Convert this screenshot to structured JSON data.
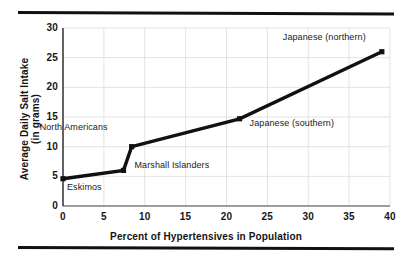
{
  "figure": {
    "top_rule": "horizontal-rule",
    "bottom_rule": "horizontal-rule"
  },
  "chart_data": {
    "type": "line",
    "title": "",
    "xlabel": "Percent of Hypertensives in Population",
    "ylabel": "Average Daily Salt Intake (in grams)",
    "ylabel_line1": "Average Daily Salt Intake",
    "ylabel_line2": "(in grams)",
    "xlim": [
      0,
      40
    ],
    "ylim": [
      0,
      30
    ],
    "xticks": [
      "0",
      "5",
      "10",
      "15",
      "20",
      "25",
      "30",
      "35",
      "40"
    ],
    "yticks": [
      "0",
      "5",
      "10",
      "15",
      "20",
      "25",
      "30"
    ],
    "grid": true,
    "legend": "none",
    "marker": "square",
    "line_color": "#111111",
    "grid_color": "#d8d8d8",
    "axis_color": "#4a4a4a",
    "x": [
      0,
      7.4,
      8.4,
      21.6,
      39.0
    ],
    "y": [
      4.6,
      6.0,
      10.0,
      14.7,
      26.0
    ],
    "point_labels": [
      "Eskimos",
      "Marshall Islanders",
      "North Americans",
      "Japanese (southern)",
      "Japanese (northern)"
    ],
    "annotations": [
      {
        "text": "Eskimos",
        "x": 0,
        "y": 4.6
      },
      {
        "text": "Marshall Islanders",
        "x": 7.4,
        "y": 6.0
      },
      {
        "text": "North Americans",
        "x": 8.4,
        "y": 10.0
      },
      {
        "text": "Japanese (southern)",
        "x": 21.6,
        "y": 14.7
      },
      {
        "text": "Japanese (northern)",
        "x": 39.0,
        "y": 26.0
      }
    ]
  }
}
